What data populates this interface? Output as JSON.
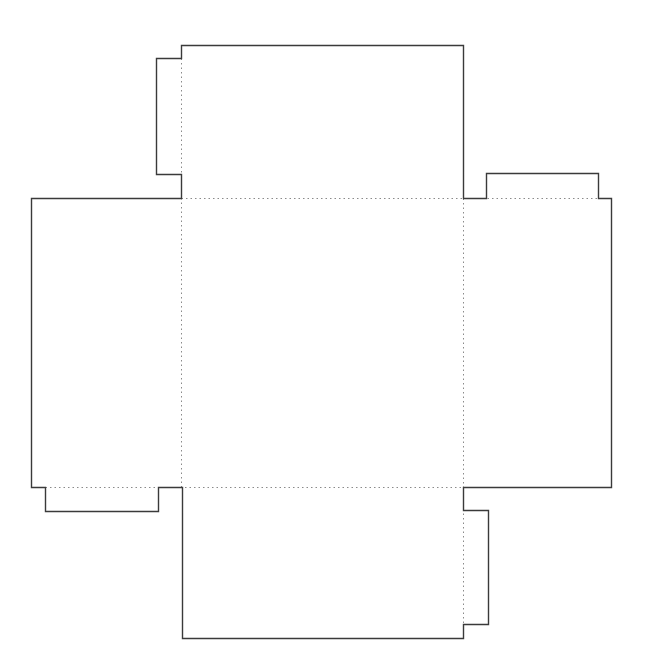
{
  "diagram": {
    "type": "box-net-template",
    "colors": {
      "background": "#ffffff",
      "cut_line": "#3a3a3a",
      "fold_line": "#8a8a8a"
    },
    "cut_outline": [
      [
        181,
        45
      ],
      [
        463,
        45
      ],
      [
        463,
        198
      ],
      [
        486,
        198
      ],
      [
        486,
        173
      ],
      [
        598,
        173
      ],
      [
        598,
        198
      ],
      [
        611,
        198
      ],
      [
        611,
        487
      ],
      [
        463,
        487
      ],
      [
        463,
        510
      ],
      [
        488,
        510
      ],
      [
        488,
        624
      ],
      [
        463,
        624
      ],
      [
        463,
        638
      ],
      [
        182,
        638
      ],
      [
        182,
        487
      ],
      [
        158,
        487
      ],
      [
        158,
        511
      ],
      [
        45,
        511
      ],
      [
        45,
        487
      ],
      [
        31,
        487
      ],
      [
        31,
        198
      ],
      [
        181,
        198
      ],
      [
        181,
        174
      ],
      [
        156,
        174
      ],
      [
        156,
        58
      ],
      [
        181,
        58
      ]
    ],
    "fold_lines": [
      {
        "name": "fold-top-base",
        "from": [
          181,
          198
        ],
        "to": [
          598,
          198
        ]
      },
      {
        "name": "fold-bottom-base",
        "from": [
          45,
          487
        ],
        "to": [
          463,
          487
        ]
      },
      {
        "name": "fold-left-base",
        "from": [
          181,
          58
        ],
        "to": [
          181,
          487
        ]
      },
      {
        "name": "fold-right-base",
        "from": [
          463,
          198
        ],
        "to": [
          463,
          624
        ]
      }
    ],
    "panels": [
      {
        "name": "top-panel",
        "x": 181,
        "y": 45,
        "w": 282,
        "h": 153
      },
      {
        "name": "base-panel",
        "x": 181,
        "y": 198,
        "w": 282,
        "h": 289
      },
      {
        "name": "left-panel",
        "x": 31,
        "y": 198,
        "w": 150,
        "h": 289
      },
      {
        "name": "right-panel",
        "x": 463,
        "y": 198,
        "w": 148,
        "h": 289
      },
      {
        "name": "bottom-panel",
        "x": 182,
        "y": 487,
        "w": 281,
        "h": 151
      }
    ],
    "tabs": [
      {
        "name": "top-left-glue-tab",
        "x": 156,
        "y": 58,
        "w": 25,
        "h": 116
      },
      {
        "name": "right-top-glue-tab",
        "x": 486,
        "y": 173,
        "w": 112,
        "h": 25
      },
      {
        "name": "left-bottom-glue-tab",
        "x": 45,
        "y": 487,
        "w": 113,
        "h": 24
      },
      {
        "name": "bottom-right-glue-tab",
        "x": 463,
        "y": 510,
        "w": 25,
        "h": 114
      }
    ]
  }
}
